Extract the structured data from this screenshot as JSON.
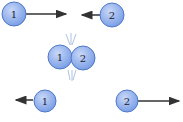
{
  "diagram": {
    "colors": {
      "ball_fill": "#8fb0ee",
      "ball_stroke": "#4f78c8",
      "arrow": "#333333",
      "impact_lines": "#9bb4d8"
    },
    "before": {
      "ball1_label": "1",
      "ball2_label": "2"
    },
    "collision": {
      "ball1_label": "1",
      "ball2_label": "2"
    },
    "after": {
      "ball1_label": "1",
      "ball2_label": "2"
    }
  }
}
